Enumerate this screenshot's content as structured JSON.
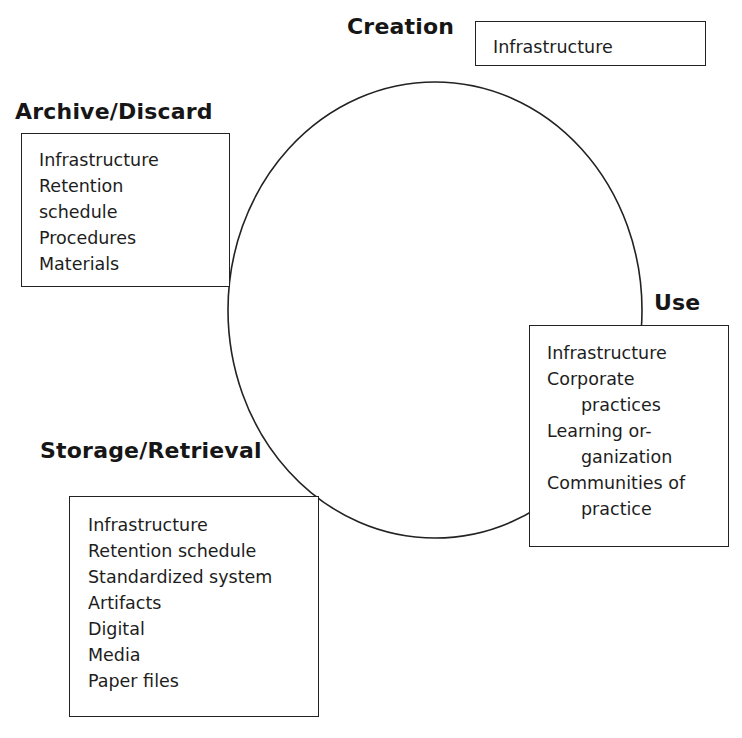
{
  "diagram": {
    "type": "lifecycle-cycle",
    "stages": {
      "creation": {
        "title": "Creation",
        "items": [
          "Infrastructure"
        ]
      },
      "use": {
        "title": "Use",
        "items": [
          "Infrastructure",
          "Corporate",
          "practices",
          "Learning or-",
          "ganization",
          "Communities of",
          "practice"
        ]
      },
      "storage": {
        "title": "Storage/Retrieval",
        "items": [
          "Infrastructure",
          "Retention schedule",
          "Standardized system",
          "Artifacts",
          "Digital",
          "Media",
          "Paper files"
        ]
      },
      "archive": {
        "title": "Archive/Discard",
        "items": [
          "Infrastructure",
          "Retention",
          "schedule",
          "Procedures",
          "Materials"
        ]
      }
    },
    "colors": {
      "line": "#222222",
      "background": "#ffffff",
      "text": "#1a1a1a"
    }
  }
}
